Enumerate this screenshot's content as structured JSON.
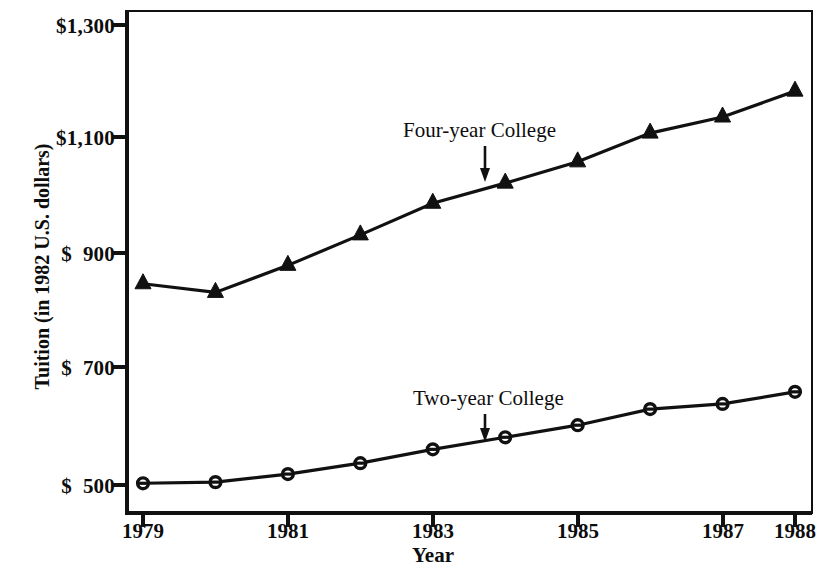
{
  "chart_data": {
    "type": "line",
    "title": "",
    "xlabel": "Year",
    "ylabel": "Tuition (in 1982 U.S. dollars)",
    "x": [
      1979,
      1980,
      1981,
      1982,
      1983,
      1984,
      1985,
      1986,
      1987,
      1988
    ],
    "xlim": [
      1978.9,
      1988.0
    ],
    "ylim": [
      460,
      1320
    ],
    "grid": false,
    "legend_position": "inline-annotations",
    "xtick_labels": [
      "1979",
      "1981",
      "1983",
      "1985",
      "1987",
      "1988"
    ],
    "xtick_values": [
      1979,
      1981,
      1983,
      1985,
      1987,
      1988
    ],
    "ytick_labels": [
      "$1,300",
      "$1,100",
      "$  900",
      "$  700",
      "$  500"
    ],
    "ytick_values": [
      1300,
      1100,
      900,
      700,
      500
    ],
    "series": [
      {
        "name": "Four-year College",
        "marker": "triangle",
        "color": "#111111",
        "values": [
          850,
          835,
          882,
          935,
          990,
          1025,
          1062,
          1112,
          1140,
          1185
        ]
      },
      {
        "name": "Two-year College",
        "marker": "circle-open",
        "color": "#111111",
        "values": [
          503,
          505,
          519,
          538,
          562,
          583,
          604,
          632,
          641,
          662
        ]
      }
    ],
    "annotations": [
      {
        "text": "Four-year College",
        "series": "Four-year College",
        "arrow_to_x": 1983.8,
        "arrow": "down"
      },
      {
        "text": "Two-year College",
        "series": "Two-year College",
        "arrow_to_x": 1983.8,
        "arrow": "down"
      }
    ]
  },
  "axes": {
    "y_title": "Tuition (in 1982 U.S. dollars)",
    "x_title": "Year",
    "y_ticks": [
      {
        "label": "$1,300"
      },
      {
        "label": "$1,100"
      },
      {
        "label": "$  900"
      },
      {
        "label": "$  700"
      },
      {
        "label": "$  500"
      }
    ],
    "x_ticks": [
      {
        "label": "1979"
      },
      {
        "label": "1981"
      },
      {
        "label": "1983"
      },
      {
        "label": "1985"
      },
      {
        "label": "1987"
      },
      {
        "label": "1988"
      }
    ]
  },
  "annotations": {
    "four_year": "Four-year College",
    "two_year": "Two-year College"
  },
  "style": {
    "background": "#ffffff",
    "ink": "#111111"
  }
}
